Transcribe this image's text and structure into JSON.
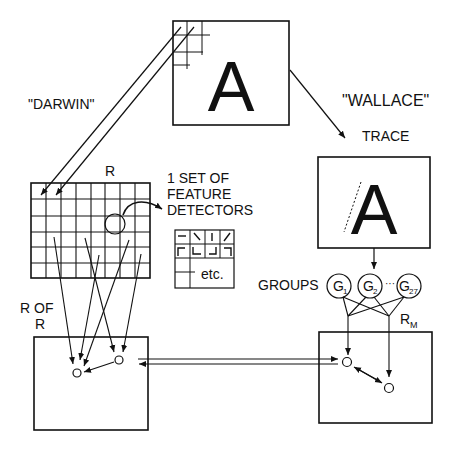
{
  "diagram": {
    "top_box": {
      "letter": "A"
    },
    "labels": {
      "darwin": "\"DARWIN\"",
      "wallace": "\"WALLACE\"",
      "trace": "TRACE",
      "r": "R",
      "feature_line1": "1 SET OF",
      "feature_line2": "FEATURE",
      "feature_line3": "DETECTORS",
      "etc": "etc.",
      "r_of_line1": "R OF",
      "r_of_line2": "R",
      "groups": "GROUPS",
      "rm_main": "R",
      "rm_sub": "M"
    },
    "trace_box": {
      "letter": "A"
    },
    "groups": [
      {
        "main": "G",
        "sub": "1"
      },
      {
        "main": "G",
        "sub": "2"
      },
      {
        "main": "G",
        "sub": "27"
      }
    ],
    "ellipsis": "···"
  }
}
